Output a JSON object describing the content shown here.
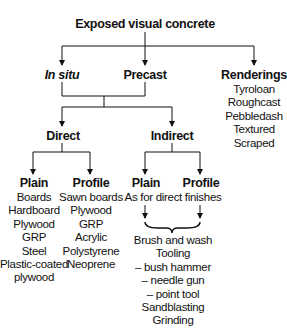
{
  "diagram": {
    "title": "Exposed visual concrete",
    "level1": {
      "in_situ": "In situ",
      "precast": "Precast",
      "renderings": {
        "label": "Renderings",
        "items": [
          "Tyroloan",
          "Roughcast",
          "Pebbledash",
          "Textured",
          "Scraped"
        ]
      }
    },
    "level2": {
      "direct": "Direct",
      "indirect": "Indirect"
    },
    "direct": {
      "plain": {
        "label": "Plain",
        "items": [
          "Boards",
          "Hardboard",
          "Plywood",
          "GRP",
          "Steel",
          "Plastic-coated",
          "plywood"
        ]
      },
      "profile": {
        "label": "Profile",
        "items": [
          "Sawn boards",
          "Plywood",
          "GRP",
          "Acrylic",
          "Polystyrene",
          "Neoprene"
        ]
      }
    },
    "indirect": {
      "plain": "Plain",
      "profile": "Profile",
      "note": "As for direct finishes",
      "finishes": [
        "Brush and wash",
        "Tooling",
        "– bush hammer",
        "– needle gun",
        "– point tool",
        "Sandblasting",
        "Grinding"
      ]
    },
    "colors": {
      "line": "#111111",
      "background": "#ffffff"
    }
  }
}
